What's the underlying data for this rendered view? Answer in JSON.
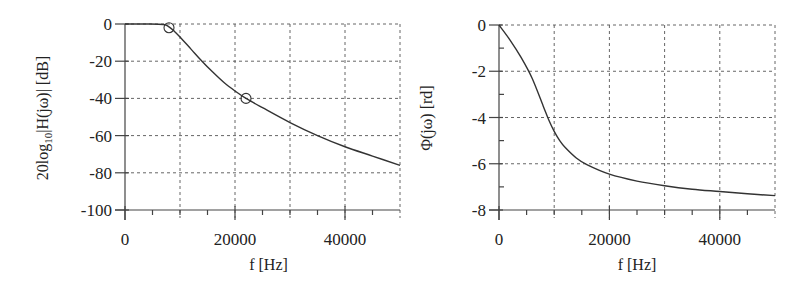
{
  "chart_data": [
    {
      "type": "line",
      "title": "",
      "xlabel": "f  [Hz]",
      "ylabel": "20log10|H(jω)| [dB]",
      "ylabel_parts": {
        "pre": "20log",
        "sub": "10",
        "post": "|H(jω)| [dB]"
      },
      "xlim": [
        0,
        50000
      ],
      "ylim": [
        -100,
        0
      ],
      "x_ticks": [
        0,
        20000,
        40000
      ],
      "x_tick_labels": [
        "0",
        "20000",
        "40000"
      ],
      "x_minor_ticks": [
        5000,
        10000,
        15000,
        25000,
        30000,
        35000,
        45000
      ],
      "y_ticks": [
        0,
        -20,
        -40,
        -60,
        -80,
        -100
      ],
      "y_tick_labels": [
        "0",
        "-20",
        "-40",
        "-60",
        "-80",
        "-100"
      ],
      "grid": true,
      "grid_x": [
        10000,
        20000,
        30000,
        40000,
        50000
      ],
      "grid_y": [
        0,
        -20,
        -40,
        -60,
        -80
      ],
      "series": [
        {
          "name": "magnitude",
          "x": [
            0,
            4000,
            7000,
            8000,
            9000,
            10000,
            12000,
            14000,
            16000,
            18000,
            20000,
            22000,
            25000,
            30000,
            35000,
            40000,
            45000,
            50000
          ],
          "y": [
            0,
            0,
            -0.3,
            -1.5,
            -4,
            -7,
            -13.5,
            -20,
            -26,
            -31.5,
            -36,
            -40,
            -45,
            -53,
            -60,
            -66,
            -71,
            -76
          ]
        }
      ],
      "markers": [
        {
          "x": 8000,
          "y": -2,
          "shape": "circle"
        },
        {
          "x": 22000,
          "y": -40,
          "shape": "circle"
        }
      ]
    },
    {
      "type": "line",
      "title": "",
      "xlabel": "f [Hz]",
      "ylabel": "Φ(jω) [rd]",
      "xlim": [
        0,
        50000
      ],
      "ylim": [
        -8,
        0
      ],
      "x_ticks": [
        0,
        20000,
        40000
      ],
      "x_tick_labels": [
        "0",
        "20000",
        "40000"
      ],
      "x_minor_ticks": [
        5000,
        10000,
        15000,
        25000,
        30000,
        35000,
        45000
      ],
      "y_ticks": [
        0,
        -2,
        -4,
        -6,
        -8
      ],
      "y_tick_labels": [
        "0",
        "-2",
        "-4",
        "-6",
        "-8"
      ],
      "y_minor_ticks": [
        -1,
        -3,
        -5,
        -7
      ],
      "grid": true,
      "grid_x": [
        10000,
        20000,
        30000,
        40000,
        50000
      ],
      "grid_y": [
        0,
        -2,
        -4,
        -6
      ],
      "series": [
        {
          "name": "phase",
          "x": [
            0,
            2000,
            4000,
            6000,
            8000,
            9000,
            10000,
            11000,
            12000,
            14000,
            16000,
            20000,
            25000,
            30000,
            35000,
            40000,
            45000,
            50000
          ],
          "y": [
            0,
            -0.65,
            -1.4,
            -2.3,
            -3.5,
            -4.1,
            -4.6,
            -5.0,
            -5.3,
            -5.75,
            -6.05,
            -6.45,
            -6.75,
            -6.95,
            -7.1,
            -7.2,
            -7.3,
            -7.38
          ]
        }
      ]
    }
  ]
}
